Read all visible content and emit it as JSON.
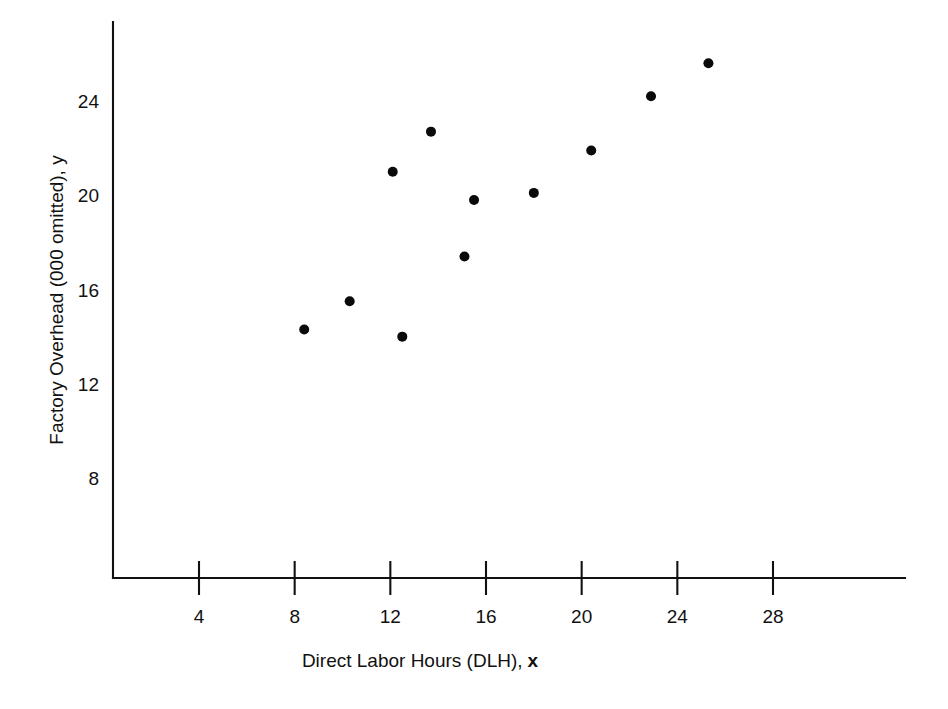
{
  "chart_data": {
    "type": "scatter",
    "title": "",
    "xlabel": "Direct Labor Hours (DLH), x",
    "xlabel_main": "Direct Labor Hours (DLH),",
    "xlabel_symbol": "x",
    "ylabel": "Factory Overhead (000 omitted), y",
    "xlim": [
      0.6,
      31.0
    ],
    "ylim": [
      5.0,
      26.5
    ],
    "xticks": [
      4,
      8,
      12,
      16,
      20,
      24,
      28
    ],
    "yticks": [
      8,
      12,
      16,
      20,
      24
    ],
    "xtick_labels": [
      "4",
      "8",
      "12",
      "16",
      "20",
      "24",
      "28"
    ],
    "ytick_labels": [
      "8",
      "12",
      "16",
      "20",
      "24"
    ],
    "grid": false,
    "legend": "none",
    "marker": "filled-circle",
    "marker_color": "#0a0a0a",
    "marker_size_px": 9,
    "points": [
      {
        "x": 8.4,
        "y": 14.3
      },
      {
        "x": 10.3,
        "y": 15.5
      },
      {
        "x": 12.1,
        "y": 21.0
      },
      {
        "x": 12.5,
        "y": 14.0
      },
      {
        "x": 13.7,
        "y": 22.7
      },
      {
        "x": 15.1,
        "y": 17.4
      },
      {
        "x": 15.5,
        "y": 19.8
      },
      {
        "x": 18.0,
        "y": 20.1
      },
      {
        "x": 20.4,
        "y": 21.9
      },
      {
        "x": 22.9,
        "y": 24.2
      },
      {
        "x": 25.3,
        "y": 25.6
      }
    ]
  },
  "axes": {
    "x_axis_name": "x-axis",
    "y_axis_name": "y-axis"
  }
}
